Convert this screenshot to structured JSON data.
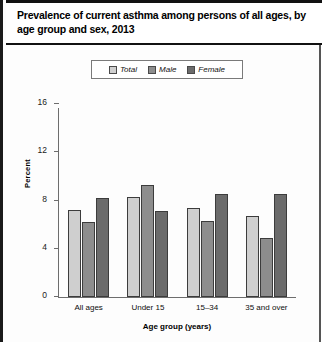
{
  "chart_title": "Prevalence of current asthma among persons of all ages, by age group and sex, 2013",
  "footnote": "",
  "legend": {
    "items": [
      {
        "label": "Total",
        "color": "#cfcfcf"
      },
      {
        "label": "Male",
        "color": "#8d8d8d"
      },
      {
        "label": "Female",
        "color": "#6b6b6b"
      }
    ]
  },
  "axes": {
    "y_title": "Percent",
    "x_title": "Age group (years)",
    "y_ticks": [
      {
        "label": "0",
        "value": 0
      },
      {
        "label": "4",
        "value": 4
      },
      {
        "label": "8",
        "value": 8
      },
      {
        "label": "12",
        "value": 12
      },
      {
        "label": "16",
        "value": 16
      }
    ]
  },
  "chart_data": {
    "type": "bar",
    "title": "Prevalence of current asthma among persons of all ages, by age group and sex, 2013",
    "xlabel": "Age group (years)",
    "ylabel": "Percent",
    "ylim": [
      0,
      16
    ],
    "grid": false,
    "legend_position": "top-center",
    "categories": [
      "All ages",
      "Under 15",
      "15–34",
      "35 and over"
    ],
    "series": [
      {
        "name": "Total",
        "color": "#cfcfcf",
        "values": [
          7.2,
          8.3,
          7.4,
          6.7
        ]
      },
      {
        "name": "Male",
        "color": "#8d8d8d",
        "values": [
          6.2,
          9.3,
          6.3,
          4.9
        ]
      },
      {
        "name": "Female",
        "color": "#6b6b6b",
        "values": [
          8.2,
          7.1,
          8.5,
          8.5
        ]
      }
    ]
  }
}
